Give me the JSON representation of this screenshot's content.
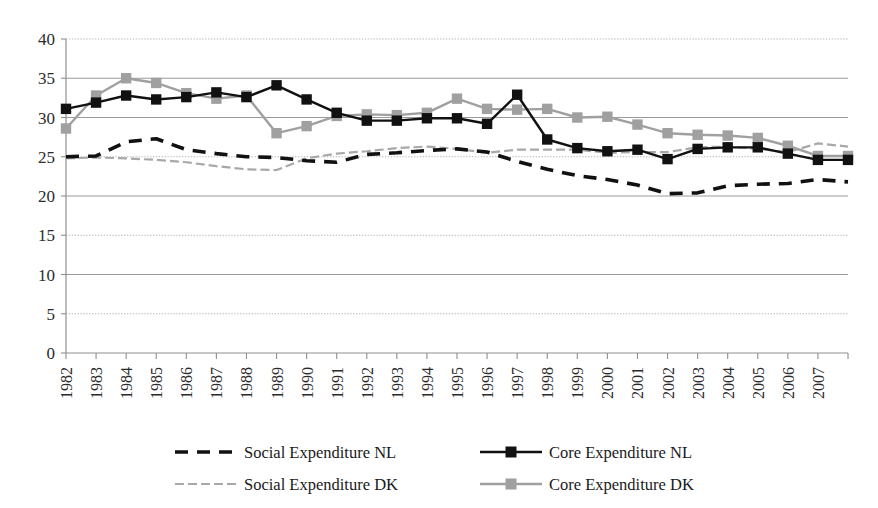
{
  "chart_data": {
    "type": "line",
    "title": "",
    "subtitle": "",
    "xlabel": "",
    "ylabel": "",
    "ylim": [
      0,
      40
    ],
    "ytick_step": 5,
    "yticks": [
      0,
      5,
      10,
      15,
      20,
      25,
      30,
      35,
      40
    ],
    "grid": true,
    "grid_axis": "y",
    "legend_position": "bottom",
    "categories": [
      "1982",
      "1983",
      "1984",
      "1985",
      "1986",
      "1987",
      "1988",
      "1989",
      "1990",
      "1991",
      "1992",
      "1993",
      "1994",
      "1995",
      "1996",
      "1997",
      "1998",
      "1999",
      "2000",
      "2001",
      "2002",
      "2003",
      "2004",
      "2005",
      "2006",
      "2007",
      "2008"
    ],
    "xtick_labels": [
      "1982",
      "1983",
      "1984",
      "1985",
      "1986",
      "1987",
      "1988",
      "1989",
      "1990",
      "1991",
      "1992",
      "1993",
      "1994",
      "1995",
      "1996",
      "1997",
      "1998",
      "1999",
      "2000",
      "2001",
      "2002",
      "2003",
      "2004",
      "2005",
      "2006",
      "2007"
    ],
    "series": [
      {
        "name": "Social Expenditure NL",
        "key": "social_nl",
        "color": "#111111",
        "style": "dashed",
        "marker": "none",
        "values": [
          25.0,
          25.1,
          26.9,
          27.3,
          25.9,
          25.4,
          25.0,
          24.9,
          24.5,
          24.3,
          25.3,
          25.5,
          25.8,
          26.0,
          25.6,
          24.4,
          23.4,
          22.6,
          22.1,
          21.4,
          20.3,
          20.4,
          21.3,
          21.5,
          21.6,
          22.1,
          21.8
        ]
      },
      {
        "name": "Core Expenditure NL",
        "key": "core_nl",
        "color": "#111111",
        "style": "solid",
        "marker": "square",
        "values": [
          31.1,
          31.9,
          32.8,
          32.3,
          32.6,
          33.2,
          32.6,
          34.1,
          32.3,
          30.6,
          29.6,
          29.6,
          29.9,
          29.9,
          29.2,
          32.9,
          27.2,
          26.1,
          25.7,
          25.9,
          24.7,
          26.0,
          26.2,
          26.2,
          25.4,
          24.6,
          24.6
        ]
      },
      {
        "name": "Social Expenditure DK",
        "key": "social_dk",
        "color": "#a8a8a8",
        "style": "dotted",
        "marker": "none",
        "values": [
          24.8,
          24.9,
          24.8,
          24.6,
          24.3,
          23.8,
          23.4,
          23.3,
          24.8,
          25.4,
          25.7,
          26.1,
          26.3,
          26.0,
          25.5,
          25.9,
          25.9,
          25.9,
          25.5,
          25.6,
          25.6,
          26.2,
          26.3,
          26.0,
          25.6,
          26.7,
          26.3
        ]
      },
      {
        "name": "Core Expenditure DK",
        "key": "core_dk",
        "color": "#a0a0a0",
        "style": "solid",
        "marker": "square",
        "values": [
          28.6,
          32.8,
          35.0,
          34.4,
          33.1,
          32.4,
          32.8,
          28.0,
          28.9,
          30.2,
          30.4,
          30.3,
          30.6,
          32.4,
          31.1,
          31.0,
          31.1,
          30.0,
          30.1,
          29.1,
          28.0,
          27.8,
          27.7,
          27.4,
          26.4,
          25.1,
          25.1
        ]
      }
    ]
  },
  "legend": {
    "items": [
      {
        "label": "Social Expenditure NL",
        "key": "social_nl"
      },
      {
        "label": "Core Expenditure NL",
        "key": "core_nl"
      },
      {
        "label": "Social Expenditure DK",
        "key": "social_dk"
      },
      {
        "label": "Core Expenditure DK",
        "key": "core_dk"
      }
    ]
  },
  "colors": {
    "black": "#111111",
    "gray": "#a0a0a0",
    "light_gray": "#a8a8a8",
    "grid_solid": "#9a9a9a",
    "grid_dotted": "#b4b4b4",
    "axis": "#8f8f8f",
    "background": "#ffffff"
  }
}
